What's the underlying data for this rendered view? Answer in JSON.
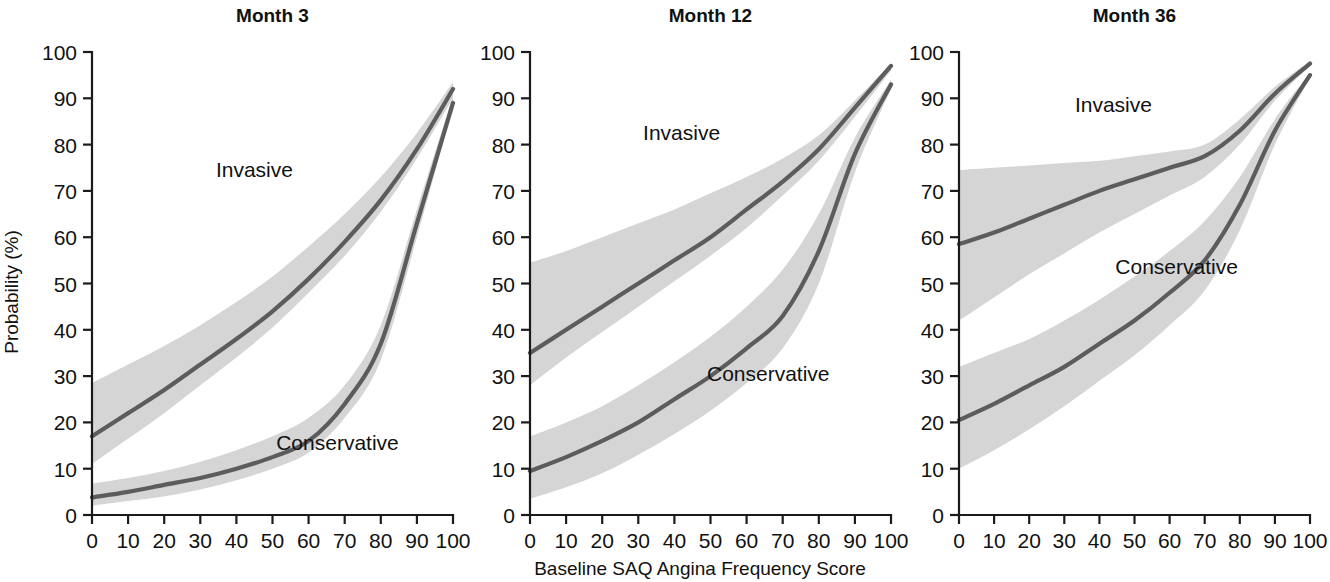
{
  "figure": {
    "xlabel": "Baseline SAQ Angina Frequency Score",
    "ylabel": "Probability (%)",
    "curve_color": "#5c5c5c",
    "band_color": "#d5d5d5",
    "axis_color": "#1b1b1b"
  },
  "chart_data": [
    {
      "type": "line",
      "title": "Month 3",
      "xlabel": "Baseline SAQ Angina Frequency Score",
      "ylabel": "Probability (%)",
      "xlim": [
        0,
        100
      ],
      "ylim": [
        0,
        100
      ],
      "xticks": [
        0,
        10,
        20,
        30,
        40,
        50,
        60,
        70,
        80,
        90,
        100
      ],
      "yticks": [
        0,
        10,
        20,
        30,
        40,
        50,
        60,
        70,
        80,
        90,
        100
      ],
      "grid": false,
      "legend": "inline-annotations",
      "x": [
        0,
        10,
        20,
        30,
        40,
        50,
        60,
        70,
        80,
        90,
        100
      ],
      "series": [
        {
          "name": "Invasive",
          "values": [
            17,
            22,
            27,
            32.5,
            38,
            44,
            51,
            59,
            68,
            79,
            92
          ],
          "ci_lower": [
            11,
            16.5,
            22,
            28,
            34,
            40.5,
            48,
            56,
            65.5,
            77,
            90
          ],
          "ci_upper": [
            28.5,
            32.5,
            36.5,
            41,
            46,
            51.5,
            58,
            65,
            73,
            82.5,
            93.5
          ],
          "label_x": 45,
          "label_y": 73
        },
        {
          "name": "Conservative",
          "values": [
            3.8,
            5,
            6.5,
            8,
            10,
            12.5,
            16,
            24,
            37,
            63,
            89
          ],
          "ci_lower": [
            2,
            3,
            4,
            5.5,
            7.5,
            10,
            13.5,
            21,
            33.5,
            60,
            88
          ],
          "ci_upper": [
            6.8,
            8,
            9.5,
            11.5,
            14,
            17,
            21,
            28,
            41,
            66,
            90.5
          ],
          "label_x": 68,
          "label_y": 14
        }
      ]
    },
    {
      "type": "line",
      "title": "Month 12",
      "xlabel": "Baseline SAQ Angina Frequency Score",
      "ylabel": "Probability (%)",
      "xlim": [
        0,
        100
      ],
      "ylim": [
        0,
        100
      ],
      "xticks": [
        0,
        10,
        20,
        30,
        40,
        50,
        60,
        70,
        80,
        90,
        100
      ],
      "yticks": [
        0,
        10,
        20,
        30,
        40,
        50,
        60,
        70,
        80,
        90,
        100
      ],
      "grid": false,
      "legend": "inline-annotations",
      "x": [
        0,
        10,
        20,
        30,
        40,
        50,
        60,
        70,
        80,
        90,
        100
      ],
      "series": [
        {
          "name": "Invasive",
          "values": [
            35,
            40,
            45,
            50,
            55,
            60,
            66,
            72,
            79,
            88,
            97
          ],
          "ci_lower": [
            28,
            34,
            39.5,
            45,
            50.5,
            56,
            62,
            69,
            76.5,
            86,
            96
          ],
          "ci_upper": [
            54.5,
            57,
            60,
            63,
            66,
            69.5,
            73,
            77,
            82,
            89.5,
            97.5
          ],
          "label_x": 42,
          "label_y": 81
        },
        {
          "name": "Conservative",
          "values": [
            9.5,
            12.5,
            16,
            20,
            25,
            30,
            36,
            43,
            57,
            78,
            93
          ],
          "ci_lower": [
            3.5,
            6,
            9,
            13,
            17.5,
            22.5,
            28.5,
            36,
            50,
            74,
            92
          ],
          "ci_upper": [
            17,
            20,
            23.5,
            28,
            33,
            38.5,
            45,
            53,
            65,
            81.5,
            94
          ],
          "label_x": 66,
          "label_y": 29
        }
      ]
    },
    {
      "type": "line",
      "title": "Month 36",
      "xlabel": "Baseline SAQ Angina Frequency Score",
      "ylabel": "Probability (%)",
      "xlim": [
        0,
        100
      ],
      "ylim": [
        0,
        100
      ],
      "xticks": [
        0,
        10,
        20,
        30,
        40,
        50,
        60,
        70,
        80,
        90,
        100
      ],
      "yticks": [
        0,
        10,
        20,
        30,
        40,
        50,
        60,
        70,
        80,
        90,
        100
      ],
      "grid": false,
      "legend": "inline-annotations",
      "x": [
        0,
        10,
        20,
        30,
        40,
        50,
        60,
        70,
        80,
        90,
        100
      ],
      "series": [
        {
          "name": "Invasive",
          "values": [
            58.5,
            61,
            64,
            67,
            70,
            72.5,
            75,
            77.5,
            83,
            91,
            97.5
          ],
          "ci_lower": [
            42,
            47,
            52,
            56.5,
            61,
            65,
            69,
            73,
            80,
            89.5,
            97
          ],
          "ci_upper": [
            74.5,
            75,
            75.5,
            76,
            76.5,
            77.5,
            78.5,
            80,
            85.5,
            92.5,
            98
          ],
          "label_x": 44,
          "label_y": 87
        },
        {
          "name": "Conservative",
          "values": [
            20.5,
            24,
            28,
            32,
            37,
            42,
            48,
            55,
            67,
            83,
            95
          ],
          "ci_lower": [
            10,
            14,
            18.5,
            23.5,
            29,
            34.5,
            41,
            48.5,
            61.5,
            80,
            94.5
          ],
          "ci_upper": [
            32,
            35,
            38,
            42,
            46.5,
            51.5,
            57,
            63.5,
            73,
            85.5,
            95.5
          ],
          "label_x": 62,
          "label_y": 52
        }
      ]
    }
  ]
}
